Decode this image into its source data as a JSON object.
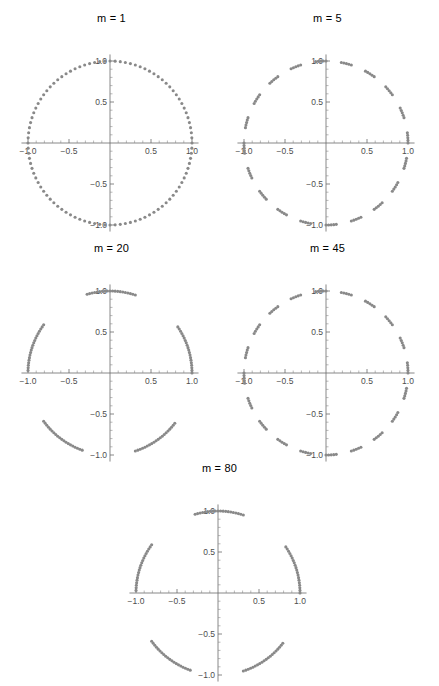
{
  "figure": {
    "background_color": "#ffffff",
    "point_color": "#898989",
    "axis_color": "#6b6b6b",
    "tick_label_color": "#4d4d4d",
    "layout": "2-2-1 grid of five scatter panels"
  },
  "panels": [
    {
      "title": "m = 1",
      "m": 1
    },
    {
      "title": "m = 5",
      "m": 5
    },
    {
      "title": "m = 20",
      "m": 20
    },
    {
      "title": "m = 45",
      "m": 45
    },
    {
      "title": "m = 80",
      "m": 80
    }
  ],
  "axes": {
    "xticks": [
      -1.0,
      -0.5,
      0.5,
      1.0
    ],
    "xtick_labels": [
      "-1.0",
      "-0.5",
      "0.5",
      "1.0"
    ],
    "yticks": [
      1.0,
      0.5,
      -0.5,
      -1.0
    ],
    "ytick_labels": [
      "1.0",
      "0.5",
      "-0.5",
      "-1.0"
    ],
    "xlim": [
      -1.08,
      1.08
    ],
    "ylim": [
      -1.08,
      1.08
    ],
    "grid": false,
    "axis_position": "zero-crossing"
  },
  "chart_data": {
    "type": "scatter",
    "title": "",
    "xlabel": "",
    "ylabel": "",
    "xlim": [
      -1.08,
      1.08
    ],
    "ylim": [
      -1.08,
      1.08
    ],
    "grid": false,
    "legend": null,
    "marker": {
      "shape": "circle",
      "size_px": 3.0,
      "color": "#898989"
    },
    "panels": [
      {
        "title": "m = 1",
        "m": 1,
        "n_points": 100,
        "radius": 1.0,
        "angles_deg": [
          0,
          3.6,
          7.2,
          10.8,
          14.4,
          18,
          21.6,
          25.2,
          28.8,
          32.4,
          36,
          39.6,
          43.2,
          46.8,
          50.4,
          54,
          57.6,
          61.2,
          64.8,
          68.4,
          72,
          75.6,
          79.2,
          82.8,
          86.4,
          90,
          93.6,
          97.2,
          100.8,
          104.4,
          108,
          111.6,
          115.2,
          118.8,
          122.4,
          126,
          129.6,
          133.2,
          136.8,
          140.4,
          144,
          147.6,
          151.2,
          154.8,
          158.4,
          162,
          165.6,
          169.2,
          172.8,
          176.4,
          180,
          183.6,
          187.2,
          190.8,
          194.4,
          198,
          201.6,
          205.2,
          208.8,
          212.4,
          216,
          219.6,
          223.2,
          226.8,
          230.4,
          234,
          237.6,
          241.2,
          244.8,
          248.4,
          252,
          255.6,
          259.2,
          262.8,
          266.4,
          270,
          273.6,
          277.2,
          280.8,
          284.4,
          288,
          291.6,
          295.2,
          298.8,
          302.4,
          306,
          309.6,
          313.2,
          316.8,
          320.4,
          324,
          327.6,
          331.2,
          334.8,
          338.4,
          342,
          345.6,
          349.2,
          352.8,
          356.4
        ]
      },
      {
        "title": "m = 5",
        "m": 5,
        "n_points": 100,
        "radius": 1.0,
        "angles_deg": [
          0,
          18,
          36,
          54,
          72,
          90,
          108,
          126,
          144,
          162,
          180,
          198,
          216,
          234,
          252,
          270,
          288,
          306,
          324,
          342,
          1.8,
          19.8,
          37.8,
          55.8,
          73.8,
          91.8,
          109.8,
          127.8,
          145.8,
          163.8,
          181.8,
          199.8,
          217.8,
          235.8,
          253.8,
          271.8,
          289.8,
          307.8,
          325.8,
          343.8,
          3.6,
          21.6,
          39.6,
          57.6,
          75.6,
          93.6,
          111.6,
          129.6,
          147.6,
          165.6,
          183.6,
          201.6,
          219.6,
          237.6,
          255.6,
          273.6,
          291.6,
          309.6,
          327.6,
          345.6,
          5.4,
          23.4,
          41.4,
          59.4,
          77.4,
          95.4,
          113.4,
          131.4,
          149.4,
          167.4,
          185.4,
          203.4,
          221.4,
          239.4,
          257.4,
          275.4,
          293.4,
          311.4,
          329.4,
          347.4,
          7.2,
          25.2,
          43.2,
          61.2,
          79.2,
          97.2,
          115.2,
          133.2,
          151.2,
          169.2,
          187.2,
          205.2,
          223.2,
          241.2,
          259.2,
          277.2,
          295.2,
          313.2,
          331.2,
          349.2
        ]
      },
      {
        "title": "m = 20",
        "m": 20,
        "n_points": 100,
        "radius": 1.0,
        "angles_deg": [
          0,
          72,
          144,
          216,
          288,
          1.8,
          73.8,
          145.8,
          217.8,
          289.8,
          3.6,
          75.6,
          147.6,
          219.6,
          291.6,
          5.4,
          77.4,
          149.4,
          221.4,
          293.4,
          7.2,
          79.2,
          151.2,
          223.2,
          295.2,
          9,
          81,
          153,
          225,
          297,
          10.8,
          82.8,
          154.8,
          226.8,
          298.8,
          12.6,
          84.6,
          156.6,
          228.6,
          300.6,
          14.4,
          86.4,
          158.4,
          230.4,
          302.4,
          16.2,
          88.2,
          160.2,
          232.2,
          304.2,
          18,
          90,
          162,
          234,
          306,
          19.8,
          91.8,
          163.8,
          235.8,
          307.8,
          21.6,
          93.6,
          165.6,
          237.6,
          309.6,
          23.4,
          95.4,
          167.4,
          239.4,
          311.4,
          25.2,
          97.2,
          169.2,
          241.2,
          313.2,
          27,
          99,
          171,
          243,
          315,
          28.8,
          100.8,
          172.8,
          244.8,
          316.8,
          30.6,
          102.6,
          174.6,
          246.6,
          318.6,
          32.4,
          104.4,
          176.4,
          248.4,
          320.4,
          34.2,
          106.2,
          178.2,
          250.2,
          322.2
        ]
      },
      {
        "title": "m = 45",
        "m": 45,
        "n_points": 100,
        "radius": 1.0,
        "angles_deg": [
          0,
          162,
          324,
          126,
          288,
          90,
          252,
          54,
          216,
          18,
          180,
          342,
          144,
          306,
          108,
          270,
          72,
          234,
          36,
          198,
          1.8,
          163.8,
          325.8,
          127.8,
          289.8,
          91.8,
          253.8,
          55.8,
          217.8,
          19.8,
          181.8,
          343.8,
          145.8,
          307.8,
          109.8,
          271.8,
          73.8,
          235.8,
          37.8,
          199.8,
          3.6,
          165.6,
          327.6,
          129.6,
          291.6,
          93.6,
          255.6,
          57.6,
          219.6,
          21.6,
          183.6,
          345.6,
          147.6,
          309.6,
          111.6,
          273.6,
          75.6,
          237.6,
          39.6,
          201.6,
          5.4,
          167.4,
          329.4,
          131.4,
          293.4,
          95.4,
          257.4,
          59.4,
          221.4,
          23.4,
          185.4,
          347.4,
          149.4,
          311.4,
          113.4,
          275.4,
          77.4,
          239.4,
          41.4,
          203.4,
          7.2,
          169.2,
          331.2,
          133.2,
          295.2,
          97.2,
          259.2,
          61.2,
          223.2,
          25.2,
          187.2,
          349.2,
          151.2,
          313.2,
          115.2,
          277.2,
          79.2,
          241.2,
          43.2,
          205.2
        ]
      },
      {
        "title": "m = 80",
        "m": 80,
        "n_points": 100,
        "radius": 1.0,
        "angles_deg": [
          0,
          288,
          216,
          144,
          72,
          1.8,
          289.8,
          217.8,
          145.8,
          73.8,
          3.6,
          291.6,
          219.6,
          147.6,
          75.6,
          5.4,
          293.4,
          221.4,
          149.4,
          77.4,
          7.2,
          295.2,
          223.2,
          151.2,
          79.2,
          9,
          297,
          225,
          153,
          81,
          10.8,
          298.8,
          226.8,
          154.8,
          82.8,
          12.6,
          300.6,
          228.6,
          156.6,
          84.6,
          14.4,
          302.4,
          230.4,
          158.4,
          86.4,
          16.2,
          304.2,
          232.2,
          160.2,
          88.2,
          18,
          306,
          234,
          162,
          90,
          19.8,
          307.8,
          235.8,
          163.8,
          91.8,
          21.6,
          309.6,
          237.6,
          165.6,
          93.6,
          23.4,
          311.4,
          239.4,
          167.4,
          95.4,
          25.2,
          313.2,
          241.2,
          169.2,
          97.2,
          27,
          315,
          243,
          171,
          99,
          28.8,
          316.8,
          244.8,
          172.8,
          100.8,
          30.6,
          318.6,
          246.6,
          174.6,
          102.6,
          32.4,
          320.4,
          248.4,
          176.4,
          104.4,
          34.2,
          322.2,
          250.2,
          178.2,
          106.2
        ]
      }
    ]
  }
}
